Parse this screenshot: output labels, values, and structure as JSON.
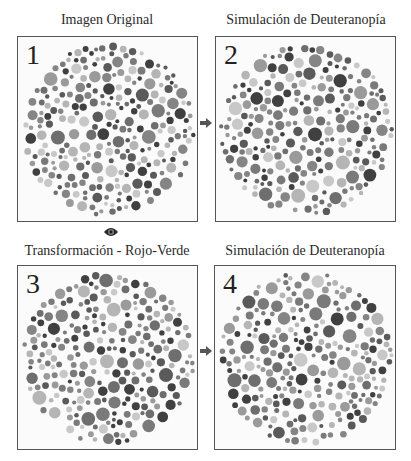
{
  "panels": [
    {
      "number": "1",
      "title": "Imagen Original",
      "seed": 11
    },
    {
      "number": "2",
      "title": "Simulación de Deuteranopía",
      "seed": 23
    },
    {
      "number": "3",
      "title": "Transformación - Rojo-Verde",
      "seed": 37
    },
    {
      "number": "4",
      "title": "Simulación de Deuteranopía",
      "seed": 51
    }
  ],
  "icons": {
    "arrow_top": "arrow-right-icon",
    "arrow_bottom": "arrow-right-icon",
    "eye": "eye-icon"
  },
  "colors": {
    "frame": "#555555",
    "dots": [
      "#5a5a5a",
      "#6e6e6e",
      "#858585",
      "#9a9a9a",
      "#b5b5b5",
      "#c8c8c8",
      "#404040",
      "#7a7a7a"
    ]
  }
}
